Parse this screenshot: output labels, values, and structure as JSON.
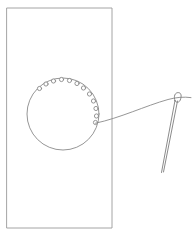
{
  "figure": {
    "title": "Sewing diagram: circular stitch-hole pattern on fabric panel with threaded needle",
    "canvas": {
      "width": 196,
      "height": 237,
      "background": "#ffffff"
    },
    "stroke_color": "#8a8a8a",
    "stroke_color_dark": "#6e6e6e",
    "stroke_width": 0.9,
    "panel": {
      "name": "fabric-panel",
      "shape": "rectangle",
      "x": 7,
      "y": 8,
      "width": 105,
      "height": 220,
      "stroke": "#9a9a9a"
    },
    "circle": {
      "name": "stitch-circle",
      "shape": "circle",
      "cx": 63,
      "cy": 114,
      "r": 36,
      "stroke": "#8a8a8a"
    },
    "holes": {
      "name": "stitch-holes",
      "count": 12,
      "radius": 2.1,
      "points": [
        {
          "cx": 39.5,
          "cy": 88.5
        },
        {
          "cx": 46.0,
          "cy": 84.0
        },
        {
          "cx": 53.5,
          "cy": 81.0
        },
        {
          "cx": 61.5,
          "cy": 79.5
        },
        {
          "cx": 69.5,
          "cy": 80.5
        },
        {
          "cx": 77.0,
          "cy": 83.5
        },
        {
          "cx": 83.5,
          "cy": 88.0
        },
        {
          "cx": 89.5,
          "cy": 94.0
        },
        {
          "cx": 93.5,
          "cy": 101.0
        },
        {
          "cx": 96.0,
          "cy": 108.5
        },
        {
          "cx": 96.5,
          "cy": 116.0
        },
        {
          "cx": 95.5,
          "cy": 122.5
        }
      ]
    },
    "thread": {
      "name": "thread-line",
      "description": "curved thread from last stitch hole to needle eye and beyond",
      "path": "M 95.5 123.2 C 120 118 145 106 168 99.5 C 176 97.3 184 96.6 191 97.6",
      "stroke": "#8a8a8a"
    },
    "needle": {
      "name": "sewing-needle",
      "tip": {
        "x": 161,
        "y": 173
      },
      "eye_top": {
        "x": 179,
        "y": 93
      },
      "shaft_left_path": "M 161.5 172.5 L 175.0 100.5",
      "shaft_right_path": "M 163.5 172.0 L 177.5 101.0",
      "eye_path": "M 175.0 100.8 C 173.4 96.0 175.0 92.6 178.2 92.6 C 181.4 92.6 181.9 96.2 180.1 100.4 C 179.2 102.4 176.2 103.2 175.0 100.8 Z",
      "stroke": "#7d7d7d"
    }
  },
  "labels": {
    "panel": "Fabric panel",
    "circle": "Stitch circle",
    "holes": "Stitch holes",
    "thread": "Thread",
    "needle": "Needle"
  }
}
